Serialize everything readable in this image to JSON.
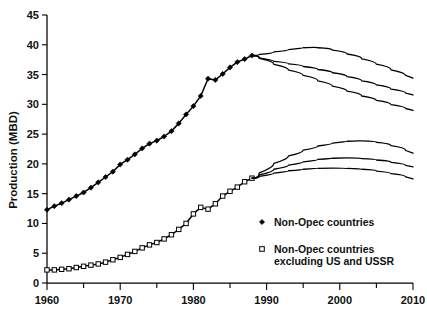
{
  "chart_data": {
    "type": "line",
    "title": "",
    "xlabel": "",
    "ylabel": "Production (MBD)",
    "xlim": [
      1960,
      2010
    ],
    "ylim": [
      0,
      45
    ],
    "ytick_step": 5,
    "xtick_step": 10,
    "xminor_step": 5,
    "grid": false,
    "legend_position": "lower-right",
    "yticks": [
      "0",
      "5",
      "10",
      "15",
      "20",
      "25",
      "30",
      "35",
      "40",
      "45"
    ],
    "xticks": [
      "1960",
      "1970",
      "1980",
      "1990",
      "2000",
      "2010"
    ],
    "legend": [
      {
        "key": "non_opec",
        "label": "Non-Opec countries",
        "marker": "filled-diamond"
      },
      {
        "key": "non_opec_ex",
        "label": "Non-Opec countries\nexcluding US and USSR",
        "marker": "open-square"
      }
    ],
    "series": [
      {
        "name": "Non-Opec countries",
        "marker": "filled-diamond",
        "x": [
          1960,
          1961,
          1962,
          1963,
          1964,
          1965,
          1966,
          1967,
          1968,
          1969,
          1970,
          1971,
          1972,
          1973,
          1974,
          1975,
          1976,
          1977,
          1978,
          1979,
          1980,
          1981,
          1982,
          1983,
          1984,
          1985,
          1986,
          1987,
          1988
        ],
        "values": [
          12.3,
          12.9,
          13.4,
          14.0,
          14.6,
          15.2,
          16.0,
          16.9,
          17.8,
          18.7,
          19.9,
          20.7,
          21.6,
          22.6,
          23.4,
          23.9,
          24.6,
          25.5,
          26.8,
          28.3,
          29.7,
          31.4,
          34.3,
          34.1,
          35.1,
          36.2,
          37.1,
          37.6,
          38.2
        ],
        "note": "historical, filled diamond markers"
      },
      {
        "name": "Non-Opec countries excluding US and USSR",
        "marker": "open-square",
        "x": [
          1960,
          1961,
          1962,
          1963,
          1964,
          1965,
          1966,
          1967,
          1968,
          1969,
          1970,
          1971,
          1972,
          1973,
          1974,
          1975,
          1976,
          1977,
          1978,
          1979,
          1980,
          1981,
          1982,
          1983,
          1984,
          1985,
          1986,
          1987,
          1988
        ],
        "values": [
          2.2,
          2.2,
          2.3,
          2.4,
          2.6,
          2.8,
          3.0,
          3.2,
          3.5,
          3.9,
          4.3,
          4.8,
          5.3,
          5.9,
          6.4,
          6.8,
          7.4,
          8.1,
          9.0,
          10.0,
          11.6,
          12.7,
          12.4,
          13.3,
          14.6,
          15.4,
          16.1,
          17.0,
          17.6
        ],
        "note": "historical, open square markers"
      }
    ],
    "projections": [
      {
        "of": "Non-Opec countries",
        "scenario": "high",
        "x": [
          1988,
          1990,
          1992,
          1994,
          1996,
          1998,
          2000,
          2002,
          2004,
          2006,
          2008,
          2010
        ],
        "values": [
          38.2,
          38.6,
          39.0,
          39.4,
          39.6,
          39.4,
          38.8,
          38.1,
          37.2,
          36.3,
          35.3,
          34.4
        ]
      },
      {
        "of": "Non-Opec countries",
        "scenario": "medium",
        "x": [
          1988,
          1990,
          1992,
          1994,
          1996,
          1998,
          2000,
          2002,
          2004,
          2006,
          2008,
          2010
        ],
        "values": [
          38.2,
          37.4,
          37.0,
          36.6,
          36.1,
          35.6,
          35.0,
          34.3,
          33.6,
          32.9,
          32.2,
          31.6
        ]
      },
      {
        "of": "Non-Opec countries",
        "scenario": "low",
        "x": [
          1988,
          1990,
          1992,
          1994,
          1996,
          1998,
          2000,
          2002,
          2004,
          2006,
          2008,
          2010
        ],
        "values": [
          38.2,
          37.2,
          36.2,
          35.3,
          34.4,
          33.5,
          32.6,
          31.8,
          31.0,
          30.3,
          29.6,
          29.0
        ]
      },
      {
        "of": "Non-Opec countries excluding US and USSR",
        "scenario": "high",
        "x": [
          1988,
          1990,
          1992,
          1994,
          1996,
          1998,
          2000,
          2002,
          2004,
          2006,
          2008,
          2010
        ],
        "values": [
          17.6,
          19.4,
          20.8,
          21.9,
          22.7,
          23.3,
          23.7,
          23.9,
          23.8,
          23.4,
          22.7,
          21.8
        ]
      },
      {
        "of": "Non-Opec countries excluding US and USSR",
        "scenario": "medium",
        "x": [
          1988,
          1990,
          1992,
          1994,
          1996,
          1998,
          2000,
          2002,
          2004,
          2006,
          2008,
          2010
        ],
        "values": [
          17.6,
          18.7,
          19.5,
          20.1,
          20.6,
          20.9,
          21.0,
          21.0,
          20.8,
          20.5,
          20.0,
          19.5
        ]
      },
      {
        "of": "Non-Opec countries excluding US and USSR",
        "scenario": "low",
        "x": [
          1988,
          1990,
          1992,
          1994,
          1996,
          1998,
          2000,
          2002,
          2004,
          2006,
          2008,
          2010
        ],
        "values": [
          17.6,
          18.2,
          18.7,
          19.0,
          19.2,
          19.3,
          19.3,
          19.2,
          19.0,
          18.6,
          18.1,
          17.5
        ]
      }
    ]
  },
  "legend_text": {
    "item1": "Non-Opec countries",
    "item2_line1": "Non-Opec countries",
    "item2_line2": "excluding US and USSR"
  },
  "colors": {
    "axis": "#000000",
    "series": "#000000",
    "background": "#ffffff"
  }
}
